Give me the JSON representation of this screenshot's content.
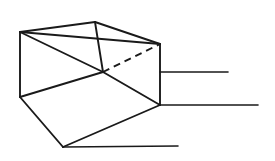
{
  "figure": {
    "canvas": {
      "width": 275,
      "height": 161
    },
    "colors": {
      "background": "#ffffff",
      "stroke": "#1a1a1a"
    },
    "stroke_widths": {
      "solid_edge": 1.9,
      "hidden_edge": 1.9,
      "projection": 1.6
    },
    "dash_pattern": "7 5",
    "vertices": {
      "top_back_left": {
        "x": 20,
        "y": 32
      },
      "top_back_right": {
        "x": 95,
        "y": 22
      },
      "top_front_right": {
        "x": 160,
        "y": 44
      },
      "inner_center": {
        "x": 103,
        "y": 72
      },
      "mid_left": {
        "x": 20,
        "y": 97
      },
      "bottom_right": {
        "x": 160,
        "y": 105
      },
      "bottom_front": {
        "x": 63,
        "y": 147
      }
    },
    "edges": [
      {
        "name": "top-rear-left-edge",
        "from": "top_back_left",
        "to": "top_back_right",
        "style": "solid"
      },
      {
        "name": "top-rear-right-edge",
        "from": "top_back_right",
        "to": "top_front_right",
        "style": "solid"
      },
      {
        "name": "top-front-diagonal-edge",
        "from": "top_back_left",
        "to": "top_front_right",
        "style": "solid"
      },
      {
        "name": "inner-vertical-edge",
        "from": "top_back_right",
        "to": "inner_center",
        "style": "solid"
      },
      {
        "name": "left-vertical-edge",
        "from": "top_back_left",
        "to": "mid_left",
        "style": "solid"
      },
      {
        "name": "right-vertical-edge",
        "from": "top_front_right",
        "to": "bottom_right",
        "style": "solid"
      },
      {
        "name": "inner-left-diagonal-edge",
        "from": "top_back_left",
        "to": "inner_center",
        "style": "solid"
      },
      {
        "name": "inner-lower-left-edge",
        "from": "mid_left",
        "to": "inner_center",
        "style": "solid"
      },
      {
        "name": "inner-floor-diagonal",
        "from": "inner_center",
        "to": "bottom_right",
        "style": "solid"
      },
      {
        "name": "front-left-edge",
        "from": "mid_left",
        "to": "bottom_front",
        "style": "solid"
      },
      {
        "name": "front-bottom-edge",
        "from": "bottom_front",
        "to": "bottom_right",
        "style": "solid"
      },
      {
        "name": "hidden-depth-edge",
        "from": "inner_center",
        "to": "top_front_right",
        "style": "dashed"
      }
    ],
    "projection_lines": [
      {
        "name": "upper-projection-line",
        "x1": 160,
        "y1": 72,
        "x2": 228,
        "y2": 72
      },
      {
        "name": "middle-projection-line",
        "x1": 160,
        "y1": 105,
        "x2": 258,
        "y2": 105
      },
      {
        "name": "lower-projection-line",
        "x1": 63,
        "y1": 147,
        "x2": 178,
        "y2": 146
      }
    ]
  }
}
